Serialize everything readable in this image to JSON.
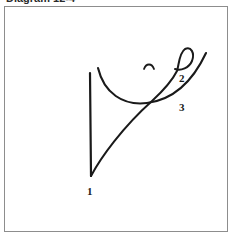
{
  "caption": {
    "text": "Diagram 12-4",
    "clipped": true
  },
  "figure": {
    "background_color": "#ffffff",
    "border_color": "#8d8d8d",
    "stroke_color": "#1a1a1a"
  },
  "labels": [
    {
      "id": "1",
      "text": "1",
      "x": 86,
      "y": 185
    },
    {
      "id": "2",
      "text": "2",
      "x": 180,
      "y": 74
    },
    {
      "id": "3",
      "text": "3",
      "x": 180,
      "y": 103
    }
  ],
  "strokes": [
    {
      "name": "vertical-line",
      "description": "straight vertical stroke on the left",
      "d": "M 85 66 L 86 169"
    },
    {
      "name": "u-curve",
      "description": "wide shallow U shaped arc sweeping from upper-left down and back up to the right tip",
      "d": "M 93 61 C 99 86, 118 99, 142 96 C 166 93, 186 78, 201 46"
    },
    {
      "name": "diagonal-with-loop",
      "description": "diagonal stroke rising from the bottom of the vertical line to a small closed loop at the upper right",
      "d": "M 86 169 C 96 150, 118 120, 147 94 C 160 82, 168 72, 172 64 C 174 58, 174 46, 180 42 C 186 39, 190 46, 187 54 C 184 61, 176 64, 170 62"
    },
    {
      "name": "small-arc-mark",
      "description": "tiny cap shaped accent mark above the diagonal",
      "d": "M 139 62 C 141 56, 147 56, 149 62"
    }
  ]
}
